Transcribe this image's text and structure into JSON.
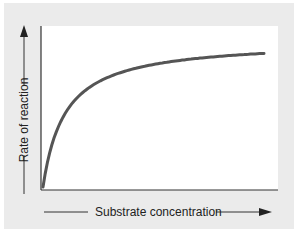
{
  "chart_data": {
    "type": "line",
    "title": "",
    "xlabel": "Substrate concentration",
    "ylabel": "Rate of reaction",
    "x_ticks": [],
    "y_ticks": [],
    "grid": false,
    "legend": null,
    "series": [
      {
        "name": "Rate of reaction vs substrate concentration",
        "description": "Hyperbolic saturation curve rising steeply from origin and leveling off to a plateau",
        "x": [
          0,
          0.05,
          0.1,
          0.2,
          0.3,
          0.4,
          0.5,
          0.6,
          0.7,
          0.8,
          0.9,
          1.0
        ],
        "values": [
          0,
          0.33,
          0.5,
          0.67,
          0.75,
          0.8,
          0.83,
          0.86,
          0.875,
          0.89,
          0.9,
          0.91
        ]
      }
    ],
    "xlim": [
      0,
      1
    ],
    "ylim": [
      0,
      1
    ],
    "colors": {
      "curve": "#555555",
      "axes": "#333333",
      "panel": "#ebebeb",
      "plot_bg": "#ffffff"
    }
  },
  "labels": {
    "x_axis": "Substrate concentration",
    "y_axis": "Rate of reaction"
  }
}
